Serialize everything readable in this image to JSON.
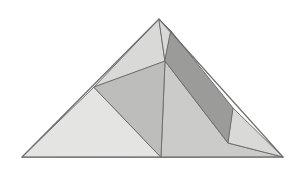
{
  "figure": {
    "canvas": {
      "width": 304,
      "height": 171,
      "background": "#ffffff"
    },
    "outline": {
      "apex": [
        159,
        19
      ],
      "bottom_left": [
        22,
        157
      ],
      "bottom_right": [
        283,
        157
      ],
      "stroke": "#6f6f6f",
      "stroke_width": 1
    },
    "palette": {
      "lightest": "#e4e4e2",
      "light": "#d9d9d7",
      "light_medium": "#cbcbc9",
      "medium": "#bdbdbb",
      "dark": "#9b9b99",
      "stroke": "#6f6f6f"
    },
    "vertices": {
      "apex": [
        159,
        19
      ],
      "left_base": [
        22,
        157
      ],
      "right_base": [
        283,
        157
      ],
      "left_mid": [
        94,
        87
      ],
      "upper_cross": [
        165,
        61
      ],
      "base_mid": [
        161,
        157
      ],
      "dark_top": [
        171,
        31
      ],
      "dark_right": [
        233,
        108
      ],
      "dark_bottom": [
        228,
        143
      ],
      "right_edge_upper": [
        171,
        31
      ],
      "left_edge_point": [
        94,
        87
      ]
    },
    "regions": [
      {
        "name": "lower-left-triangle",
        "fill": "#e4e4e2",
        "points": "22,157 94,87 161,157"
      },
      {
        "name": "upper-left-triangle",
        "fill": "#d9d9d7",
        "points": "94,87 159,19 165,61"
      },
      {
        "name": "middle-wedge",
        "fill": "#bdbdbb",
        "points": "94,87 165,61 161,157"
      },
      {
        "name": "lower-right-triangle",
        "fill": "#cbcbc9",
        "points": "161,157 165,61 228,143 283,157"
      },
      {
        "name": "dark-parallelogram",
        "fill": "#9b9b99",
        "points": "171,31 233,108 228,143 165,61"
      },
      {
        "name": "right-upper-sliver",
        "fill": "#d9d9d7",
        "points": "159,19 171,31 165,61"
      },
      {
        "name": "far-right-triangle",
        "fill": "#d9d9d7",
        "points": "233,108 283,157 228,143"
      }
    ],
    "edges": [
      {
        "name": "left-outer-edge",
        "from": [
          22,
          157
        ],
        "to": [
          159,
          19
        ]
      },
      {
        "name": "right-outer-edge",
        "from": [
          159,
          19
        ],
        "to": [
          283,
          157
        ]
      },
      {
        "name": "base-edge",
        "from": [
          22,
          157
        ],
        "to": [
          283,
          157
        ]
      },
      {
        "name": "left-mid-to-upper-cross",
        "from": [
          94,
          87
        ],
        "to": [
          165,
          61
        ]
      },
      {
        "name": "left-mid-to-base-mid",
        "from": [
          94,
          87
        ],
        "to": [
          161,
          157
        ]
      },
      {
        "name": "upper-cross-to-base-mid",
        "from": [
          165,
          61
        ],
        "to": [
          161,
          157
        ]
      },
      {
        "name": "dark-top-to-dark-right",
        "from": [
          171,
          31
        ],
        "to": [
          233,
          108
        ]
      },
      {
        "name": "dark-right-to-dark-bottom",
        "from": [
          233,
          108
        ],
        "to": [
          228,
          143
        ]
      },
      {
        "name": "dark-bottom-to-upper-cross",
        "from": [
          228,
          143
        ],
        "to": [
          165,
          61
        ]
      },
      {
        "name": "upper-cross-to-dark-top",
        "from": [
          165,
          61
        ],
        "to": [
          171,
          31
        ]
      }
    ]
  }
}
